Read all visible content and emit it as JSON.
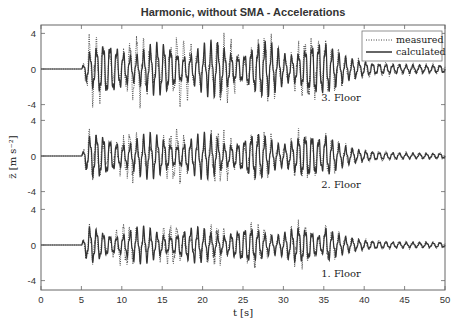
{
  "chart_data": {
    "type": "line",
    "title": "Harmonic, without SMA - Accelerations",
    "xlabel": "t [s]",
    "ylabel": "z̈ [m s⁻²]",
    "xlim": [
      0,
      50
    ],
    "xticks": [
      0,
      5,
      10,
      15,
      20,
      25,
      30,
      35,
      40,
      45,
      50
    ],
    "grid": false,
    "legend_position": "upper right",
    "legend": [
      {
        "name": "measured",
        "style": "dotted"
      },
      {
        "name": "calculated",
        "style": "solid"
      }
    ],
    "panels": [
      {
        "name": "3. Floor",
        "yticks": [
          4,
          0,
          -4
        ],
        "excitation_start": 5,
        "excitation_end": 35,
        "amplitude_calculated": 3.0,
        "amplitude_measured": 3.8,
        "amplitude_decay_tail": 0.6,
        "frequency_hz": 1.2
      },
      {
        "name": "2. Floor",
        "yticks": [
          4,
          0,
          -4
        ],
        "excitation_start": 5,
        "excitation_end": 35,
        "amplitude_calculated": 2.5,
        "amplitude_measured": 3.0,
        "amplitude_decay_tail": 0.4,
        "frequency_hz": 1.2
      },
      {
        "name": "1. Floor",
        "yticks": [
          4,
          0,
          -4
        ],
        "excitation_start": 5,
        "excitation_end": 35,
        "amplitude_calculated": 2.0,
        "amplitude_measured": 2.5,
        "amplitude_decay_tail": 0.4,
        "frequency_hz": 1.2
      }
    ],
    "series": [
      {
        "name": "measured",
        "description": "Oscillating acceleration, zero until t=5 s, harmonic response ~±3-4 m/s² until t=35 s, then decays to ~±0.5"
      },
      {
        "name": "calculated",
        "description": "Simulated acceleration, flat zero until t=5 s, harmonic ~±2-3 m/s² until t=35 s, then small residual"
      }
    ]
  },
  "colors": {
    "axis": "#555555",
    "calculated": "#333333",
    "measured": "#444444",
    "text": "#333333"
  }
}
